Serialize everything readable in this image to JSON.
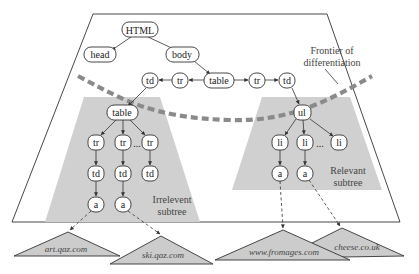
{
  "diagram": {
    "nodes": {
      "html": "HTML",
      "head": "head",
      "body": "body",
      "table_root": "table",
      "tr_left": "tr",
      "td_left": "td",
      "tr_right": "tr",
      "td_right": "td",
      "table_inner": "table",
      "tr_1": "tr",
      "tr_2": "tr",
      "tr_3": "tr",
      "td_1": "td",
      "td_2": "td",
      "td_3": "td",
      "a_1": "a",
      "a_2": "a",
      "ul": "ul",
      "li_1": "li",
      "li_2": "li",
      "li_3": "li",
      "a_3": "a",
      "a_4": "a",
      "ellipsis": "..."
    },
    "labels": {
      "frontier_line1": "Frontier of",
      "frontier_line2": "differentiation",
      "irrelevant_line1": "Irrelevent",
      "irrelevant_line2": "subtree",
      "relevant_line1": "Relevant",
      "relevant_line2": "subtree"
    },
    "sites": {
      "site_1": "art.qaz.com",
      "site_2": "ski.qaz.com",
      "site_3": "www.fromages.com",
      "site_4": "cheese.co.uk"
    },
    "colors": {
      "shade": "#d0d0d0",
      "frontier": "#8a8a8a",
      "stroke": "#333333"
    }
  }
}
